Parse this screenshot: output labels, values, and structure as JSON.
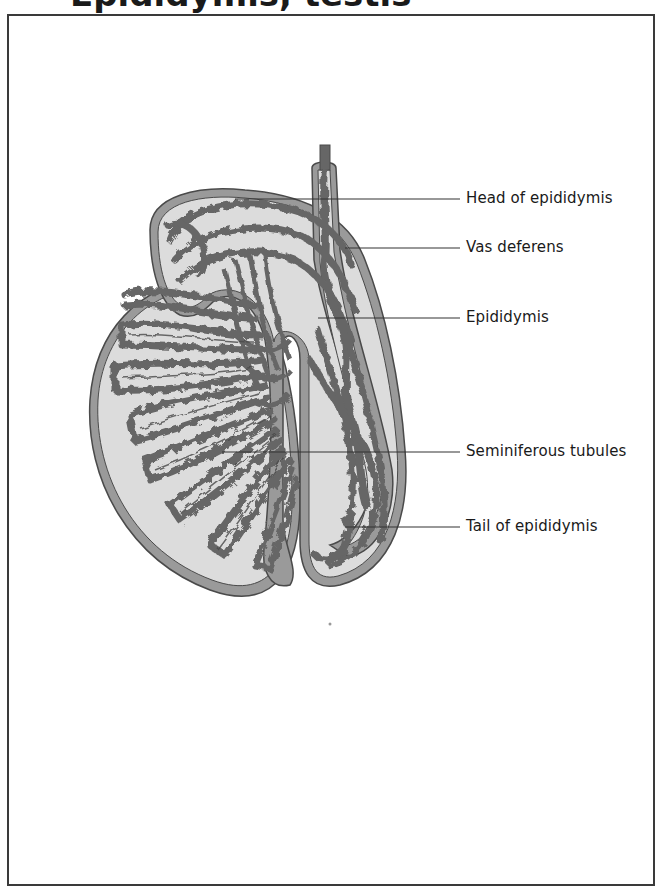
{
  "header": {
    "title_partial": "Epididymis, testis"
  },
  "diagram": {
    "colors": {
      "tubule": "#666666",
      "tubule_outline": "#4a4a4a",
      "capsule": "#9a9a9a",
      "fill": "#dcdcdc",
      "frame": "#3a3a3a",
      "leader": "#333333"
    },
    "labels": [
      {
        "id": "head-of-epididymis",
        "text": "Head of epididymis"
      },
      {
        "id": "vas-deferens",
        "text": "Vas deferens"
      },
      {
        "id": "epididymis",
        "text": "Epididymis"
      },
      {
        "id": "seminiferous-tubules",
        "text": "Seminiferous tubules"
      },
      {
        "id": "tail-of-epididymis",
        "text": "Tail of epididymis"
      }
    ]
  }
}
